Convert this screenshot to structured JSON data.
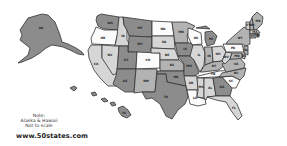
{
  "note": {
    "line1": "Note:",
    "line2": "Alaska & Hawaii",
    "line3": "Not to scale"
  },
  "site": "www.50states.com",
  "shades": {
    "dark": "#8c8c8c",
    "mid": "#b3b3b3",
    "light": "#d6d6d6",
    "white": "#fbfbfb"
  },
  "states": [
    {
      "abbr": "AK",
      "shade": "dark"
    },
    {
      "abbr": "HI",
      "shade": "dark"
    },
    {
      "abbr": "WA",
      "shade": "dark"
    },
    {
      "abbr": "OR",
      "shade": "white"
    },
    {
      "abbr": "CA",
      "shade": "light"
    },
    {
      "abbr": "ID",
      "shade": "light"
    },
    {
      "abbr": "NV",
      "shade": "light"
    },
    {
      "abbr": "MT",
      "shade": "dark"
    },
    {
      "abbr": "WY",
      "shade": "dark"
    },
    {
      "abbr": "UT",
      "shade": "dark"
    },
    {
      "abbr": "AZ",
      "shade": "dark"
    },
    {
      "abbr": "CO",
      "shade": "white"
    },
    {
      "abbr": "NM",
      "shade": "mid"
    },
    {
      "abbr": "ND",
      "shade": "white"
    },
    {
      "abbr": "SD",
      "shade": "light"
    },
    {
      "abbr": "NE",
      "shade": "light"
    },
    {
      "abbr": "KS",
      "shade": "mid"
    },
    {
      "abbr": "OK",
      "shade": "dark"
    },
    {
      "abbr": "TX",
      "shade": "dark"
    },
    {
      "abbr": "MN",
      "shade": "mid"
    },
    {
      "abbr": "IA",
      "shade": "dark"
    },
    {
      "abbr": "MO",
      "shade": "dark"
    },
    {
      "abbr": "AR",
      "shade": "light"
    },
    {
      "abbr": "LA",
      "shade": "white"
    },
    {
      "abbr": "WI",
      "shade": "white"
    },
    {
      "abbr": "IL",
      "shade": "light"
    },
    {
      "abbr": "MI",
      "shade": "dark"
    },
    {
      "abbr": "IN",
      "shade": "mid"
    },
    {
      "abbr": "OH",
      "shade": "light"
    },
    {
      "abbr": "KY",
      "shade": "mid"
    },
    {
      "abbr": "TN",
      "shade": "white"
    },
    {
      "abbr": "MS",
      "shade": "light"
    },
    {
      "abbr": "AL",
      "shade": "light"
    },
    {
      "abbr": "GA",
      "shade": "dark"
    },
    {
      "abbr": "FL",
      "shade": "light"
    },
    {
      "abbr": "SC",
      "shade": "white"
    },
    {
      "abbr": "NC",
      "shade": "mid"
    },
    {
      "abbr": "VA",
      "shade": "mid"
    },
    {
      "abbr": "WV",
      "shade": "light"
    },
    {
      "abbr": "PA",
      "shade": "white"
    },
    {
      "abbr": "NY",
      "shade": "mid"
    },
    {
      "abbr": "VT",
      "shade": "light"
    },
    {
      "abbr": "NH",
      "shade": "mid"
    },
    {
      "abbr": "ME",
      "shade": "mid"
    },
    {
      "abbr": "MA",
      "shade": "light"
    },
    {
      "abbr": "RI",
      "shade": "dark"
    },
    {
      "abbr": "CT",
      "shade": "mid"
    },
    {
      "abbr": "NJ",
      "shade": "mid"
    },
    {
      "abbr": "DE",
      "shade": "light"
    },
    {
      "abbr": "MD",
      "shade": "mid"
    }
  ]
}
